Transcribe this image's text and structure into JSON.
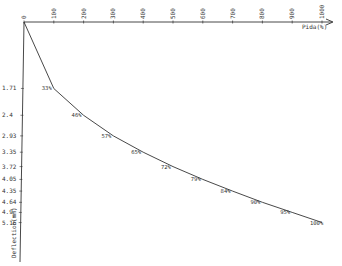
{
  "chart_data": {
    "type": "line",
    "title": "",
    "xlabel": "Pida(%)",
    "ylabel": "Deflection(mm)",
    "x_ticks": [
      "0",
      "100",
      "200",
      "300",
      "400",
      "500",
      "600",
      "700",
      "800",
      "900",
      "1000"
    ],
    "y_ticks": [
      "1.71",
      "2.4",
      "2.93",
      "3.35",
      "3.72",
      "4.05",
      "4.35",
      "4.64",
      "4.9",
      "5.16"
    ],
    "xlim": [
      0,
      1000
    ],
    "y_axis_inverted": true,
    "grid": false,
    "points": [
      {
        "x": 0,
        "y": 0,
        "label": ""
      },
      {
        "x": 100,
        "y": 1.71,
        "label": "33%"
      },
      {
        "x": 200,
        "y": 2.4,
        "label": "46%"
      },
      {
        "x": 300,
        "y": 2.93,
        "label": "57%"
      },
      {
        "x": 400,
        "y": 3.35,
        "label": "65%"
      },
      {
        "x": 500,
        "y": 3.72,
        "label": "72%"
      },
      {
        "x": 600,
        "y": 4.05,
        "label": "79%"
      },
      {
        "x": 700,
        "y": 4.35,
        "label": "84%"
      },
      {
        "x": 800,
        "y": 4.64,
        "label": "90%"
      },
      {
        "x": 900,
        "y": 4.9,
        "label": "95%"
      },
      {
        "x": 1000,
        "y": 5.16,
        "label": "100%"
      }
    ],
    "colors": {
      "line": "#333333",
      "axis": "#333333"
    }
  }
}
